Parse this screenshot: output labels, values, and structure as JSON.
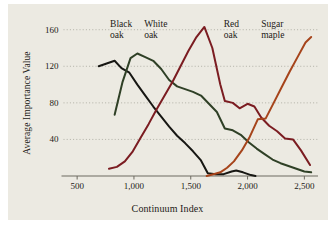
{
  "figure": {
    "panel_bg": "#eceae2",
    "page_bg": "#ffffff",
    "text_color": "#1c1a17"
  },
  "chart_data": {
    "type": "line",
    "title": "",
    "xlabel": "Continuum Index",
    "ylabel": "Average Importance Value",
    "xlim": [
      380,
      2620
    ],
    "ylim": [
      0,
      175
    ],
    "xticks": [
      500,
      1000,
      1500,
      2000,
      2500
    ],
    "xticklabels": [
      "500",
      "1,000",
      "1,500",
      "2,000",
      "2,500"
    ],
    "yticks": [
      40,
      80,
      120,
      160
    ],
    "yticklabels": [
      "40",
      "80",
      "120",
      "160"
    ],
    "grid": "horizontal-dotted",
    "legend": "inline-labels-above-curves",
    "series": [
      {
        "name": "Black oak",
        "color": "#171713",
        "label_x": 790,
        "label_y": 166,
        "x": [
          690,
          760,
          830,
          890,
          960,
          1030,
          1100,
          1170,
          1240,
          1310,
          1380,
          1450,
          1520,
          1590,
          1650,
          1720,
          1790,
          1860,
          1900,
          1960,
          2030,
          2070
        ],
        "y": [
          120,
          123,
          126,
          118,
          113,
          100,
          88,
          76,
          65,
          54,
          44,
          36,
          27,
          17,
          3,
          2,
          2,
          5,
          6,
          4,
          1,
          0
        ]
      },
      {
        "name": "White oak",
        "color": "#2f4026",
        "label_x": 1090,
        "label_y": 166,
        "x": [
          830,
          900,
          970,
          1030,
          1100,
          1170,
          1240,
          1310,
          1380,
          1450,
          1520,
          1590,
          1660,
          1730,
          1800,
          1870,
          1940,
          2010,
          2080,
          2150,
          2220,
          2290,
          2360,
          2430,
          2500,
          2560
        ],
        "y": [
          67,
          103,
          129,
          134,
          130,
          126,
          117,
          105,
          98,
          95,
          92,
          88,
          79,
          70,
          52,
          50,
          45,
          37,
          30,
          24,
          18,
          14,
          11,
          8,
          5,
          4
        ]
      },
      {
        "name": "Red oak",
        "color": "#7b1c21",
        "label_x": 1790,
        "label_y": 166,
        "x": [
          780,
          850,
          920,
          990,
          1060,
          1130,
          1200,
          1270,
          1340,
          1410,
          1480,
          1550,
          1620,
          1690,
          1760,
          1800,
          1870,
          1930,
          2000,
          2060,
          2120,
          2190,
          2260,
          2330,
          2400,
          2470,
          2550
        ],
        "y": [
          8,
          10,
          16,
          27,
          42,
          57,
          73,
          88,
          103,
          120,
          137,
          152,
          163,
          140,
          100,
          82,
          80,
          74,
          79,
          76,
          64,
          55,
          49,
          41,
          40,
          28,
          12
        ]
      },
      {
        "name": "Sugar maple",
        "color": "#a6441b",
        "label_x": 2120,
        "label_y": 166,
        "x": [
          1640,
          1700,
          1760,
          1820,
          1880,
          1950,
          2020,
          2090,
          2160,
          2230,
          2300,
          2370,
          2440,
          2510,
          2560
        ],
        "y": [
          0,
          2,
          4,
          9,
          16,
          28,
          43,
          62,
          63,
          80,
          97,
          114,
          130,
          146,
          152
        ]
      }
    ]
  }
}
